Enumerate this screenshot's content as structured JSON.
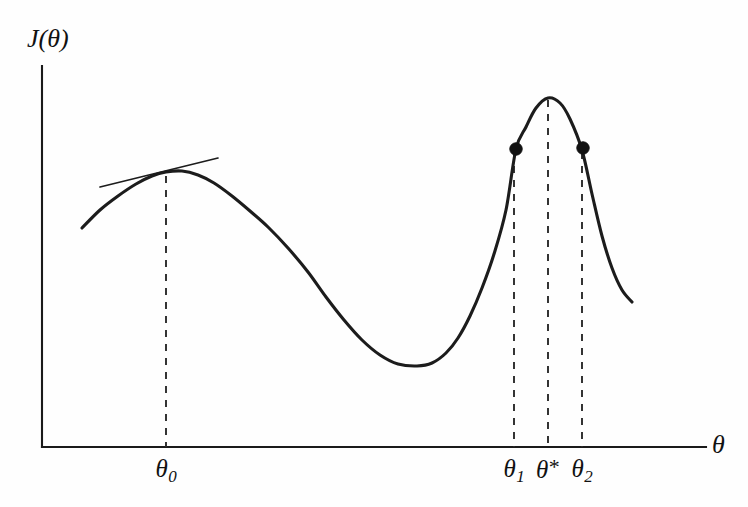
{
  "figure": {
    "background_color": "#fefefe",
    "ink_color": "#1a1a1a",
    "axes": {
      "y_axis_label": "J(θ)",
      "x_axis_label": "θ",
      "origin": [
        42,
        447
      ],
      "y_axis_top": [
        42,
        66
      ],
      "x_axis_right": [
        706,
        447
      ]
    },
    "tick_labels": [
      {
        "name": "theta0",
        "base": "θ",
        "sub": "0",
        "sup": "",
        "x": 166
      },
      {
        "name": "theta1",
        "base": "θ",
        "sub": "1",
        "sup": "",
        "x": 514
      },
      {
        "name": "thetastar",
        "base": "θ",
        "sub": "",
        "sup": "*",
        "x": 548
      },
      {
        "name": "theta2",
        "base": "θ",
        "sub": "2",
        "sup": "",
        "x": 582
      }
    ]
  },
  "chart_data": {
    "type": "line",
    "title": "",
    "xlabel": "θ",
    "ylabel": "J(θ)",
    "grid": false,
    "legend": null,
    "xlim": [
      42,
      706
    ],
    "ylim": [
      447,
      66
    ],
    "curve_points": [
      [
        82,
        228
      ],
      [
        100,
        210
      ],
      [
        118,
        196
      ],
      [
        136,
        184
      ],
      [
        152,
        176
      ],
      [
        166,
        172
      ],
      [
        182,
        171
      ],
      [
        198,
        175
      ],
      [
        214,
        183
      ],
      [
        232,
        196
      ],
      [
        250,
        211
      ],
      [
        268,
        227
      ],
      [
        288,
        248
      ],
      [
        308,
        272
      ],
      [
        326,
        297
      ],
      [
        344,
        320
      ],
      [
        362,
        340
      ],
      [
        380,
        355
      ],
      [
        398,
        364
      ],
      [
        417,
        366
      ],
      [
        432,
        363
      ],
      [
        446,
        353
      ],
      [
        458,
        338
      ],
      [
        470,
        316
      ],
      [
        482,
        288
      ],
      [
        494,
        254
      ],
      [
        506,
        210
      ],
      [
        516,
        149
      ],
      [
        526,
        127
      ],
      [
        536,
        108
      ],
      [
        548,
        98
      ],
      [
        560,
        103
      ],
      [
        570,
        119
      ],
      [
        582,
        150
      ],
      [
        592,
        194
      ],
      [
        602,
        236
      ],
      [
        612,
        268
      ],
      [
        622,
        290
      ],
      [
        632,
        302
      ]
    ],
    "tangent_line": {
      "label": "tangent at theta_0",
      "start": [
        100,
        187
      ],
      "end": [
        218,
        158
      ],
      "touch_point": [
        166,
        172
      ]
    },
    "markers": [
      {
        "label": "θ₁",
        "x": 516,
        "y": 149
      },
      {
        "label": "θ₂",
        "x": 583,
        "y": 148
      }
    ],
    "guides": [
      {
        "label": "θ₀",
        "x": 166,
        "y_top": 176,
        "y_bottom": 447
      },
      {
        "label": "θ₁",
        "x": 514,
        "y_top": 152,
        "y_bottom": 447
      },
      {
        "label": "θ*",
        "x": 548,
        "y_top": 100,
        "y_bottom": 447
      },
      {
        "label": "θ₂",
        "x": 582,
        "y_top": 152,
        "y_bottom": 447
      }
    ],
    "features": {
      "local_maximum": [
        172,
        171
      ],
      "minimum": [
        417,
        366
      ],
      "global_maximum": [
        548,
        98
      ],
      "curve_start": [
        82,
        228
      ],
      "curve_end": [
        632,
        302
      ]
    }
  }
}
